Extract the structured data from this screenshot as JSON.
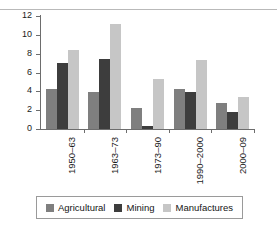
{
  "chart_data": {
    "type": "bar",
    "title": "",
    "xlabel": "",
    "ylabel": "",
    "ylim": [
      0,
      12
    ],
    "yticks": [
      0,
      2,
      4,
      6,
      8,
      10,
      12
    ],
    "grid": false,
    "legend_position": "bottom",
    "categories": [
      "1950–63",
      "1963–73",
      "1973–90",
      "1990–2000",
      "2000–09"
    ],
    "series": [
      {
        "name": "Agricultural",
        "color": "#7f7f7f",
        "values": [
          4.3,
          3.9,
          2.25,
          4.3,
          2.8
        ]
      },
      {
        "name": "Mining",
        "color": "#3d3d3d",
        "values": [
          7.0,
          7.45,
          0.35,
          3.9,
          1.85
        ]
      },
      {
        "name": "Manufactures",
        "color": "#c6c6c6",
        "values": [
          8.4,
          11.1,
          5.3,
          7.3,
          3.35
        ]
      }
    ]
  }
}
